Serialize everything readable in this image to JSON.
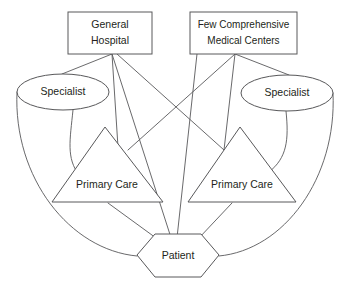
{
  "diagram": {
    "type": "healthcare-network-diagram",
    "canvas": {
      "width": 347,
      "height": 292
    },
    "colors": {
      "background": "#ffffff",
      "stroke": "#58585a",
      "text": "#231f20"
    },
    "nodes": [
      {
        "id": "general-hospital",
        "label_line1": "General",
        "label_line2": "Hospital",
        "shape": "rectangle",
        "x": 68,
        "y": 12,
        "width": 84,
        "height": 42
      },
      {
        "id": "comprehensive-medical-centers",
        "label_line1": "Few Comprehensive",
        "label_line2": "Medical Centers",
        "shape": "rectangle",
        "x": 190,
        "y": 12,
        "width": 107,
        "height": 42
      },
      {
        "id": "specialist-left",
        "label": "Specialist",
        "shape": "ellipse",
        "cx": 63,
        "cy": 92,
        "rx": 46,
        "ry": 18
      },
      {
        "id": "specialist-right",
        "label": "Specialist",
        "shape": "ellipse",
        "cx": 287,
        "cy": 93,
        "rx": 46,
        "ry": 18
      },
      {
        "id": "primary-care-left",
        "label": "Primary Care",
        "shape": "triangle",
        "apex_x": 105,
        "apex_y": 127,
        "base_left_x": 52,
        "base_right_x": 163,
        "base_y": 202
      },
      {
        "id": "primary-care-right",
        "label": "Primary Care",
        "shape": "triangle",
        "apex_x": 240,
        "apex_y": 127,
        "base_left_x": 188,
        "base_right_x": 296,
        "base_y": 202
      },
      {
        "id": "patient",
        "label": "Patient",
        "shape": "hexagon",
        "left_x": 137,
        "right_x": 219,
        "top_y": 234,
        "bottom_y": 277,
        "mid_y": 255,
        "inset": 18
      }
    ],
    "edges": [
      {
        "from": "general-hospital",
        "to": "specialist-left",
        "path": "M112,54 L62,74"
      },
      {
        "from": "general-hospital",
        "to": "primary-care-left-apex",
        "path": "M112,54 L118,147"
      },
      {
        "from": "general-hospital",
        "to": "patient",
        "path": "M112,54 L174,247"
      },
      {
        "from": "general-hospital",
        "to": "primary-care-right-apex",
        "path": "M117,54 L224,150"
      },
      {
        "from": "comprehensive-medical-centers",
        "to": "specialist-right",
        "path": "M235,54 L289,75"
      },
      {
        "from": "comprehensive-medical-centers",
        "to": "primary-care-right-apex",
        "path": "M235,54 L224,150"
      },
      {
        "from": "comprehensive-medical-centers",
        "to": "patient",
        "path": "M197,54 L176,247"
      },
      {
        "from": "comprehensive-medical-centers",
        "to": "primary-care-left-apex",
        "path": "M235,54 L128,150"
      },
      {
        "from": "specialist-left",
        "to": "primary-care-left",
        "path": "M73,110 C70,140 66,158 79,175"
      },
      {
        "from": "specialist-right",
        "to": "primary-care-right",
        "path": "M286,111 C289,140 287,158 269,172"
      },
      {
        "from": "specialist-left",
        "to": "patient",
        "path": "M17,92 C13,175 72,250 137,256"
      },
      {
        "from": "specialist-right",
        "to": "patient",
        "path": "M333,93 C337,175 283,250 219,256"
      },
      {
        "from": "primary-care-left",
        "to": "patient",
        "path": "M108,203 L156,238"
      },
      {
        "from": "primary-care-right",
        "to": "patient",
        "path": "M232,203 L199,238"
      }
    ]
  }
}
